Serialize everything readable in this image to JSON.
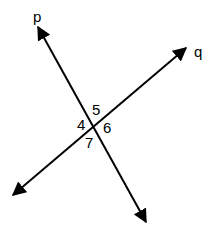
{
  "diagram": {
    "type": "intersecting-lines",
    "lines": [
      {
        "name": "p",
        "label": "p",
        "from": [
          146,
          222
        ],
        "to": [
          38,
          27
        ],
        "label_pos": [
          33,
          22
        ]
      },
      {
        "name": "q",
        "label": "q",
        "from": [
          13,
          195
        ],
        "to": [
          186,
          48
        ],
        "label_pos": [
          194,
          57
        ]
      }
    ],
    "intersection": [
      95,
      119
    ],
    "angles": [
      {
        "label": "5",
        "pos": [
          92,
          115
        ]
      },
      {
        "label": "4",
        "pos": [
          77,
          130
        ]
      },
      {
        "label": "6",
        "pos": [
          103,
          133
        ]
      },
      {
        "label": "7",
        "pos": [
          85,
          148
        ]
      }
    ],
    "colors": {
      "stroke": "#000000",
      "background": "#ffffff"
    }
  }
}
